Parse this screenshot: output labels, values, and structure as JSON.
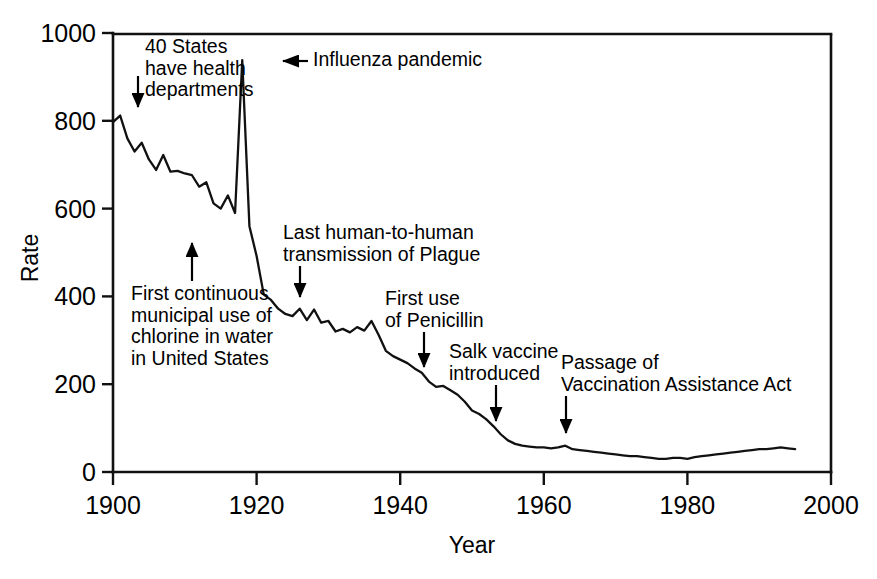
{
  "chart_data": {
    "type": "line",
    "title": "",
    "xlabel": "Year",
    "ylabel": "Rate",
    "xlim": [
      1900,
      2000
    ],
    "ylim": [
      0,
      1000
    ],
    "xticks": [
      1900,
      1920,
      1940,
      1960,
      1980,
      2000
    ],
    "yticks": [
      0,
      200,
      400,
      600,
      800,
      1000
    ],
    "grid": false,
    "legend": null,
    "series": [
      {
        "name": "Crude death rate for infectious diseases",
        "x": [
          1900,
          1901,
          1902,
          1903,
          1904,
          1905,
          1906,
          1907,
          1908,
          1909,
          1910,
          1911,
          1912,
          1913,
          1914,
          1915,
          1916,
          1917,
          1918,
          1919,
          1920,
          1921,
          1922,
          1923,
          1924,
          1925,
          1926,
          1927,
          1928,
          1929,
          1930,
          1931,
          1932,
          1933,
          1934,
          1935,
          1936,
          1937,
          1938,
          1939,
          1940,
          1941,
          1942,
          1943,
          1944,
          1945,
          1946,
          1947,
          1948,
          1949,
          1950,
          1951,
          1952,
          1953,
          1954,
          1955,
          1956,
          1957,
          1958,
          1959,
          1960,
          1961,
          1962,
          1963,
          1964,
          1965,
          1966,
          1967,
          1968,
          1969,
          1970,
          1971,
          1972,
          1973,
          1974,
          1975,
          1976,
          1977,
          1978,
          1979,
          1980,
          1981,
          1982,
          1983,
          1984,
          1985,
          1986,
          1987,
          1988,
          1989,
          1990,
          1991,
          1992,
          1993,
          1994,
          1995
        ],
        "values": [
          797,
          812,
          760,
          730,
          750,
          712,
          688,
          722,
          684,
          686,
          680,
          676,
          650,
          660,
          612,
          600,
          630,
          590,
          938,
          560,
          492,
          404,
          392,
          372,
          360,
          355,
          372,
          346,
          370,
          340,
          344,
          320,
          326,
          318,
          330,
          322,
          344,
          312,
          276,
          264,
          256,
          248,
          236,
          226,
          206,
          194,
          196,
          186,
          176,
          160,
          140,
          132,
          120,
          104,
          86,
          72,
          64,
          60,
          58,
          56,
          56,
          54,
          56,
          60,
          52,
          50,
          48,
          46,
          44,
          42,
          40,
          38,
          36,
          36,
          34,
          32,
          30,
          30,
          32,
          32,
          30,
          34,
          36,
          38,
          40,
          42,
          44,
          46,
          48,
          50,
          52,
          52,
          54,
          56,
          54,
          52
        ]
      }
    ],
    "annotations": [
      {
        "id": "forty-states",
        "text": "40 States\nhave health\ndepartments",
        "arrow": "down",
        "text_x_px": 145,
        "text_y_px": 36,
        "arrow_x_px": 138,
        "arrow_from_y_px": 76,
        "arrow_to_y_px": 122
      },
      {
        "id": "influenza-pandemic",
        "text": "Influenza pandemic",
        "arrow": "left",
        "text_x_px": 313,
        "text_y_px": 49,
        "arrow_y_px": 61,
        "arrow_from_x_px": 308,
        "arrow_to_x_px": 266
      },
      {
        "id": "chlorine-water",
        "text": "First continuous\nmunicipal use of\nchlorine in water\nin United States",
        "arrow": "up",
        "text_x_px": 131,
        "text_y_px": 283,
        "arrow_x_px": 192,
        "arrow_from_y_px": 281,
        "arrow_to_y_px": 228
      },
      {
        "id": "plague-transmission",
        "text": "Last human-to-human\ntransmission of Plague",
        "arrow": "down",
        "text_x_px": 283,
        "text_y_px": 222,
        "arrow_x_px": 300,
        "arrow_from_y_px": 266,
        "arrow_to_y_px": 312
      },
      {
        "id": "first-penicillin",
        "text": "First use\nof Penicillin",
        "arrow": "down",
        "text_x_px": 385,
        "text_y_px": 288,
        "arrow_x_px": 424,
        "arrow_from_y_px": 332,
        "arrow_to_y_px": 382
      },
      {
        "id": "salk-vaccine",
        "text": "Salk vaccine\nintroduced",
        "arrow": "down",
        "text_x_px": 449,
        "text_y_px": 341,
        "arrow_x_px": 496,
        "arrow_from_y_px": 385,
        "arrow_to_y_px": 436
      },
      {
        "id": "vaccination-assistance-act",
        "text": "Passage of\nVaccination Assistance Act",
        "arrow": "down",
        "text_x_px": 561,
        "text_y_px": 352,
        "arrow_x_px": 566,
        "arrow_from_y_px": 396,
        "arrow_to_y_px": 448
      }
    ]
  },
  "colors": {
    "line": "#111111",
    "axis": "#111111",
    "text": "#000000",
    "background": "#ffffff"
  }
}
